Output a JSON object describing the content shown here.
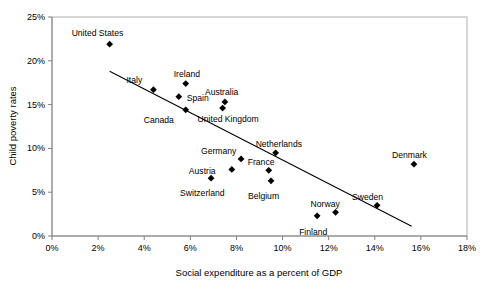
{
  "chart_data": {
    "type": "scatter",
    "title": "",
    "xlabel": "Social expenditure as a percent of GDP",
    "ylabel": "Child poverty rates",
    "xlim": [
      0,
      18
    ],
    "ylim": [
      0,
      25
    ],
    "xticks": [
      "0%",
      "2%",
      "4%",
      "6%",
      "8%",
      "10%",
      "12%",
      "14%",
      "16%",
      "18%"
    ],
    "xtick_values": [
      0,
      2,
      4,
      6,
      8,
      10,
      12,
      14,
      16,
      18
    ],
    "yticks": [
      "0%",
      "5%",
      "10%",
      "15%",
      "20%",
      "25%"
    ],
    "ytick_values": [
      0,
      5,
      10,
      15,
      20,
      25
    ],
    "grid": false,
    "legend": "none",
    "marker": "diamond",
    "marker_color": "#000000",
    "points": [
      {
        "label": "United States",
        "x": 2.5,
        "y": 21.9,
        "label_dx": -38,
        "label_dy": -15
      },
      {
        "label": "Italy",
        "x": 4.4,
        "y": 16.7,
        "label_dx": -27,
        "label_dy": -14
      },
      {
        "label": "Ireland",
        "x": 5.8,
        "y": 17.4,
        "label_dx": -12,
        "label_dy": -14
      },
      {
        "label": "Spain",
        "x": 5.5,
        "y": 15.9,
        "label_dx": 8,
        "label_dy": -3
      },
      {
        "label": "Canada",
        "x": 5.8,
        "y": 14.4,
        "label_dx": -42,
        "label_dy": 6
      },
      {
        "label": "Australia",
        "x": 7.5,
        "y": 15.3,
        "label_dx": -20,
        "label_dy": -14
      },
      {
        "label": "United Kingdom",
        "x": 7.4,
        "y": 14.6,
        "label_dx": -25,
        "label_dy": 7
      },
      {
        "label": "Netherlands",
        "x": 9.7,
        "y": 9.5,
        "label_dx": -20,
        "label_dy": -13
      },
      {
        "label": "Germany",
        "x": 8.2,
        "y": 8.8,
        "label_dx": -40,
        "label_dy": -12
      },
      {
        "label": "France",
        "x": 9.4,
        "y": 7.5,
        "label_dx": -21,
        "label_dy": -12
      },
      {
        "label": "Austria",
        "x": 7.8,
        "y": 7.6,
        "label_dx": -43,
        "label_dy": -2
      },
      {
        "label": "Switzerland",
        "x": 6.9,
        "y": 6.6,
        "label_dx": -31,
        "label_dy": 11
      },
      {
        "label": "Belgium",
        "x": 9.5,
        "y": 6.3,
        "label_dx": -23,
        "label_dy": 11
      },
      {
        "label": "Denmark",
        "x": 15.7,
        "y": 8.2,
        "label_dx": -22,
        "label_dy": -13
      },
      {
        "label": "Sweden",
        "x": 14.1,
        "y": 3.5,
        "label_dx": -25,
        "label_dy": -12
      },
      {
        "label": "Norway",
        "x": 12.3,
        "y": 2.7,
        "label_dx": -25,
        "label_dy": -12
      },
      {
        "label": "Finland",
        "x": 11.5,
        "y": 2.3,
        "label_dx": -18,
        "label_dy": 12
      }
    ],
    "trendline": {
      "x_start": 2.5,
      "y_start": 18.8,
      "x_end": 15.6,
      "y_end": 1.1
    }
  }
}
